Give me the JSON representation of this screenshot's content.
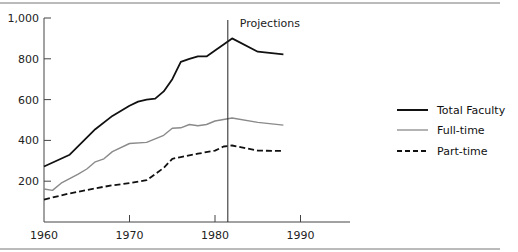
{
  "chart_data": {
    "type": "line",
    "title": "",
    "xlabel": "",
    "ylabel": "",
    "xlim": [
      1960,
      1996
    ],
    "ylim": [
      0,
      1000
    ],
    "x_ticks": [
      1960,
      1970,
      1980,
      1990
    ],
    "x_tick_labels": [
      "1960",
      "1970",
      "1980",
      "1990"
    ],
    "y_ticks": [
      200,
      400,
      600,
      800,
      1000
    ],
    "y_tick_labels": [
      "200",
      "400",
      "600",
      "800",
      "1,000"
    ],
    "grid": false,
    "legend_position": "right",
    "annotations": [
      {
        "type": "vertical-line",
        "x": 1981.5,
        "label": "Projections"
      }
    ],
    "series": [
      {
        "name": "Total Faculty",
        "style": "solid-thick",
        "color": "#111111",
        "x": [
          1960,
          1963,
          1966,
          1968,
          1970,
          1971,
          1972,
          1973,
          1974,
          1975,
          1976,
          1977,
          1978,
          1979,
          1980,
          1981,
          1982,
          1985,
          1988
        ],
        "values": [
          272,
          330,
          455,
          520,
          570,
          590,
          600,
          605,
          640,
          700,
          785,
          800,
          812,
          812,
          840,
          870,
          900,
          835,
          822
        ]
      },
      {
        "name": "Full-time",
        "style": "solid-thin-gray",
        "color": "#8a8a8a",
        "x": [
          1960,
          1961,
          1962,
          1964,
          1965,
          1966,
          1967,
          1968,
          1970,
          1972,
          1974,
          1975,
          1976,
          1977,
          1978,
          1979,
          1980,
          1982,
          1985,
          1988
        ],
        "values": [
          162,
          155,
          190,
          235,
          260,
          295,
          310,
          345,
          385,
          390,
          425,
          460,
          462,
          478,
          472,
          478,
          495,
          510,
          488,
          475
        ]
      },
      {
        "name": "Part-time",
        "style": "dashed",
        "color": "#111111",
        "x": [
          1960,
          1963,
          1966,
          1968,
          1970,
          1972,
          1974,
          1975,
          1976,
          1978,
          1980,
          1981,
          1982,
          1985,
          1988
        ],
        "values": [
          110,
          140,
          165,
          180,
          190,
          205,
          265,
          310,
          318,
          335,
          350,
          370,
          375,
          350,
          348
        ]
      }
    ]
  },
  "annotation_label": "Projections",
  "legend": [
    {
      "label": "Total Faculty"
    },
    {
      "label": "Full-time"
    },
    {
      "label": "Part-time"
    }
  ]
}
